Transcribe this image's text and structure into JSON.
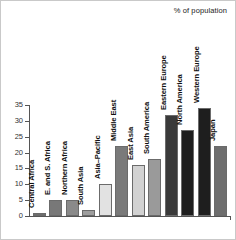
{
  "header": {
    "note": "% of population"
  },
  "chart_data": {
    "type": "bar",
    "title": "",
    "subtitle": "",
    "xlabel": "",
    "ylabel": "% of population",
    "ylim": [
      0,
      35
    ],
    "yticks": [
      0,
      5,
      10,
      15,
      20,
      25,
      30,
      35
    ],
    "grid": false,
    "legend": null,
    "categories": [
      "Central Africa",
      "E. and S. Africa",
      "Northern Africa",
      "South Asia",
      "Asia–Pacific",
      "Middle East",
      "East Asia",
      "South America",
      "Eastern Europe",
      "North America",
      "Western Europe",
      "Japan"
    ],
    "values": [
      1,
      5,
      5,
      2,
      10,
      22,
      16,
      18,
      32,
      27,
      34,
      22
    ],
    "bar_colors": [
      "#6e6e6e",
      "#787878",
      "#8a8a8a",
      "#9e9e9e",
      "#e2e2e2",
      "#7a7a7a",
      "#d2d2d2",
      "#9a9a9a",
      "#3a3a3a",
      "#1e1e1e",
      "#1e1e1e",
      "#6e6e6e"
    ]
  }
}
